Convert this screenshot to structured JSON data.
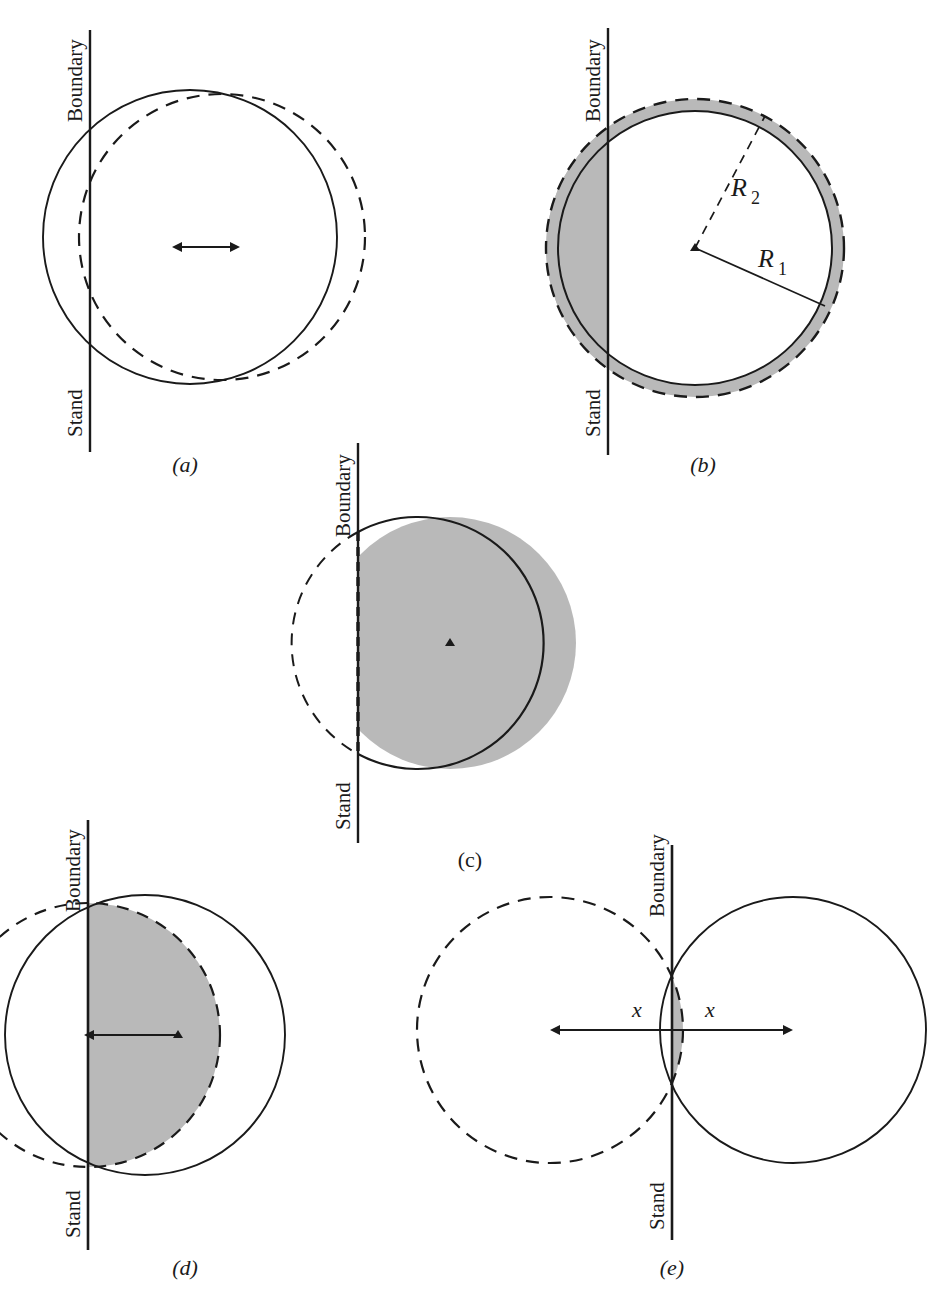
{
  "figure": {
    "type": "geometry-diagram",
    "colors": {
      "stroke": "#1a1a1a",
      "shade_gray": "#b9b9b9",
      "background": "#ffffff"
    },
    "axis_labels": {
      "boundary": "Boundary",
      "stand": "Stand"
    },
    "panels": [
      {
        "id": "a",
        "caption": "(a)",
        "caption_style": "italic",
        "shapes": "solid circle overlapping dashed circle offset to the right, double-headed arrow at center",
        "labels": []
      },
      {
        "id": "b",
        "caption": "(b)",
        "caption_style": "italic",
        "shapes": "inner solid circle R1 inside outer dashed circle R2 with gray annulus, gray cap left of boundary",
        "labels": [
          "R",
          "2",
          "R",
          "1"
        ],
        "radius_inner_label": "R",
        "radius_inner_sub": "1",
        "radius_outer_label": "R",
        "radius_outer_sub": "2"
      },
      {
        "id": "c",
        "caption": "(c)",
        "caption_style": "upright",
        "shapes": "gray filled circle right of boundary with dashed vertical chord and dashed arc bulging left",
        "labels": []
      },
      {
        "id": "d",
        "caption": "(d)",
        "caption_style": "italic",
        "shapes": "solid circle centered right of boundary, dashed circle centered on boundary, gray lens intersection, arrow from boundary to center",
        "labels": []
      },
      {
        "id": "e",
        "caption": "(e)",
        "caption_style": "italic",
        "shapes": "dashed circle left and solid circle right intersecting on boundary, gray lens region, double arrow with two x labels",
        "labels": [
          "x",
          "x"
        ],
        "distance_left_label": "x",
        "distance_right_label": "x"
      }
    ]
  }
}
